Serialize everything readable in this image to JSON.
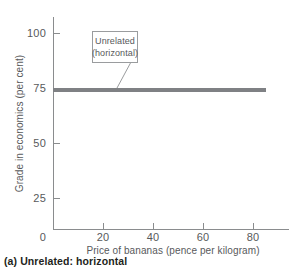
{
  "chart_data": {
    "type": "line",
    "title": "",
    "caption": "(a) Unrelated: horizontal",
    "xlabel": "Price of bananas (pence per kilogram)",
    "ylabel": "Grade in economics (per cent)",
    "xlim": [
      0,
      95
    ],
    "ylim": [
      0,
      108
    ],
    "xticks": [
      0,
      20,
      40,
      60,
      80
    ],
    "xtick_labels": [
      "0",
      "20",
      "40",
      "60",
      "80"
    ],
    "yticks": [
      0,
      25,
      50,
      75,
      100
    ],
    "ytick_labels": [
      "0",
      "25",
      "50",
      "75",
      "100"
    ],
    "grid": false,
    "legend": "none",
    "series": [
      {
        "name": "Unrelated (horizontal)",
        "color": "#7f8184",
        "x": [
          0,
          85
        ],
        "values": [
          74,
          74
        ]
      }
    ],
    "annotations": [
      {
        "name": "unrelated-horizontal-callout",
        "line1": "Unrelated",
        "line2": "(horizontal)",
        "boxed": true,
        "points_to_x": 30,
        "points_to_y": 74
      }
    ]
  },
  "colors": {
    "axis": "#8a8c8e",
    "text": "#58595b",
    "caption": "#231f20",
    "data_line": "#7f8184",
    "annotation_border": "#9a9c9e",
    "background": "#ffffff"
  }
}
